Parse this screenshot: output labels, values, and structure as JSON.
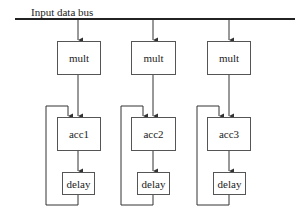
{
  "bus": {
    "label": "Input data bus"
  },
  "columns": [
    {
      "mult": "mult",
      "acc": "acc1",
      "delay": "delay"
    },
    {
      "mult": "mult",
      "acc": "acc2",
      "delay": "delay"
    },
    {
      "mult": "mult",
      "acc": "acc3",
      "delay": "delay"
    }
  ],
  "colors": {
    "line": "#333333",
    "box_border": "#555555",
    "background": "#ffffff"
  }
}
